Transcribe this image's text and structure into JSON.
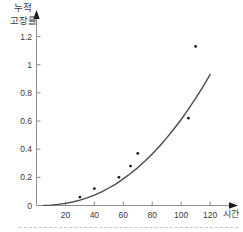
{
  "chart_data": {
    "type": "scatter",
    "title": "",
    "ylabel_lines": [
      "누적",
      "고장률"
    ],
    "xlabel": "시간",
    "xlim": [
      0,
      130
    ],
    "ylim": [
      0,
      1.3
    ],
    "grid": false,
    "x_ticks": [
      {
        "value": 20,
        "label": "20"
      },
      {
        "value": 40,
        "label": "40"
      },
      {
        "value": 60,
        "label": "60"
      },
      {
        "value": 80,
        "label": "80"
      },
      {
        "value": 100,
        "label": "100"
      },
      {
        "value": 120,
        "label": "120"
      }
    ],
    "y_ticks": [
      {
        "value": 0,
        "label": "0"
      },
      {
        "value": 0.2,
        "label": "0.2"
      },
      {
        "value": 0.4,
        "label": "0.4"
      },
      {
        "value": 0.6,
        "label": "0.6"
      },
      {
        "value": 0.8,
        "label": "0.8"
      },
      {
        "value": 1,
        "label": "1"
      },
      {
        "value": 1.2,
        "label": "1.2"
      }
    ],
    "points": [
      [
        30,
        0.06
      ],
      [
        40,
        0.12
      ],
      [
        57,
        0.2
      ],
      [
        65,
        0.28
      ],
      [
        70,
        0.37
      ],
      [
        105,
        0.62
      ],
      [
        110,
        1.13
      ]
    ],
    "curve_samples": [
      [
        5,
        0.001
      ],
      [
        10,
        0.003
      ],
      [
        15,
        0.008
      ],
      [
        20,
        0.015
      ],
      [
        25,
        0.025
      ],
      [
        30,
        0.038
      ],
      [
        35,
        0.055
      ],
      [
        40,
        0.074
      ],
      [
        45,
        0.097
      ],
      [
        50,
        0.124
      ],
      [
        55,
        0.154
      ],
      [
        60,
        0.189
      ],
      [
        65,
        0.227
      ],
      [
        70,
        0.269
      ],
      [
        75,
        0.315
      ],
      [
        80,
        0.366
      ],
      [
        85,
        0.421
      ],
      [
        90,
        0.48
      ],
      [
        95,
        0.543
      ],
      [
        100,
        0.611
      ],
      [
        105,
        0.684
      ],
      [
        110,
        0.761
      ],
      [
        115,
        0.843
      ],
      [
        120,
        0.93
      ]
    ],
    "colors": {
      "axis": "#8c8c8c",
      "arrow": "#1a1a1a",
      "curve": "#4a4a4a",
      "point": "#1a1a1a",
      "text": "#3a3a3a",
      "divider": "#c6c6c6"
    }
  }
}
